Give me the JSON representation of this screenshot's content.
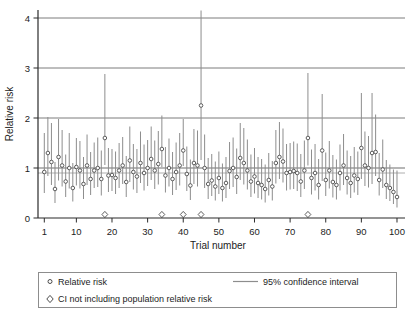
{
  "colors": {
    "background": "#ffffff",
    "axis": "#2b2b2b",
    "gridline": "#6e6e6e",
    "ci_line": "#8d8d8d",
    "marker_stroke": "#4c4c4c",
    "marker_fill": "#ffffff",
    "population_line": "#9a9a9a",
    "legend_border": "#8d8d8d",
    "text": "#1c1c1c"
  },
  "chart_data": {
    "type": "scatter",
    "title": "",
    "xlabel": "Trial number",
    "ylabel": "Relative risk",
    "x_ticks": [
      1,
      10,
      20,
      30,
      40,
      50,
      60,
      70,
      80,
      90,
      100
    ],
    "y_ticks": [
      0,
      1,
      2,
      3,
      4
    ],
    "xlim": [
      1,
      100
    ],
    "ylim": [
      0,
      4.16
    ],
    "grid": "horizontal-at-integer-y",
    "reference_lines": [
      {
        "name": "unity-gridline",
        "y": 1.0
      },
      {
        "name": "population-relative-risk",
        "y": 0.9
      }
    ],
    "legend_position": "bottom-box",
    "marker_legend": [
      {
        "marker": "open-circle",
        "label": "Relative risk"
      },
      {
        "marker": "open-diamond",
        "label": "CI not including population relative risk"
      },
      {
        "marker": "line",
        "label": "95% confidence interval"
      }
    ],
    "diamond_trials": [
      18,
      34,
      40,
      45,
      75
    ],
    "diamond_y": 0.07,
    "columns": [
      "trial",
      "rr",
      "ci_lo",
      "ci_hi"
    ],
    "rows": [
      [
        1,
        0.92,
        0.5,
        1.7
      ],
      [
        2,
        1.3,
        0.84,
        2.02
      ],
      [
        3,
        1.12,
        0.66,
        1.9
      ],
      [
        4,
        0.58,
        0.3,
        1.12
      ],
      [
        5,
        1.22,
        0.75,
        1.98
      ],
      [
        6,
        1.05,
        0.63,
        1.76
      ],
      [
        7,
        0.73,
        0.42,
        1.27
      ],
      [
        8,
        1.0,
        0.59,
        1.7
      ],
      [
        9,
        0.6,
        0.33,
        1.1
      ],
      [
        10,
        1.02,
        0.65,
        1.6
      ],
      [
        11,
        0.95,
        0.59,
        1.54
      ],
      [
        12,
        0.68,
        0.38,
        1.22
      ],
      [
        13,
        1.05,
        0.66,
        1.67
      ],
      [
        14,
        0.78,
        0.46,
        1.32
      ],
      [
        15,
        0.95,
        0.6,
        1.51
      ],
      [
        16,
        1.0,
        0.62,
        1.61
      ],
      [
        17,
        0.78,
        0.45,
        1.35
      ],
      [
        18,
        1.6,
        1.06,
        2.88
      ],
      [
        19,
        0.85,
        0.52,
        1.4
      ],
      [
        20,
        0.86,
        0.54,
        1.38
      ],
      [
        21,
        0.8,
        0.48,
        1.33
      ],
      [
        22,
        0.95,
        0.6,
        1.5
      ],
      [
        23,
        1.05,
        0.68,
        1.62
      ],
      [
        24,
        0.72,
        0.42,
        1.24
      ],
      [
        25,
        1.15,
        0.72,
        1.83
      ],
      [
        26,
        0.92,
        0.57,
        1.48
      ],
      [
        27,
        0.83,
        0.5,
        1.38
      ],
      [
        28,
        1.1,
        0.7,
        1.73
      ],
      [
        29,
        0.9,
        0.55,
        1.47
      ],
      [
        30,
        1.0,
        0.64,
        1.56
      ],
      [
        31,
        1.18,
        0.76,
        1.83
      ],
      [
        32,
        0.95,
        0.58,
        1.55
      ],
      [
        33,
        1.08,
        0.67,
        1.74
      ],
      [
        34,
        1.38,
        1.02,
        2.05
      ],
      [
        35,
        0.85,
        0.51,
        1.42
      ],
      [
        36,
        1.0,
        0.63,
        1.59
      ],
      [
        37,
        0.78,
        0.46,
        1.32
      ],
      [
        38,
        0.92,
        0.56,
        1.51
      ],
      [
        39,
        1.05,
        0.65,
        1.7
      ],
      [
        40,
        1.35,
        1.04,
        1.98
      ],
      [
        41,
        0.88,
        0.54,
        1.43
      ],
      [
        42,
        0.65,
        0.36,
        1.17
      ],
      [
        43,
        1.1,
        0.68,
        1.78
      ],
      [
        44,
        1.05,
        0.63,
        1.75
      ],
      [
        45,
        2.25,
        1.16,
        4.15
      ],
      [
        46,
        1.0,
        0.6,
        1.67
      ],
      [
        47,
        0.68,
        0.38,
        1.2
      ],
      [
        48,
        0.75,
        0.44,
        1.28
      ],
      [
        49,
        0.63,
        0.35,
        1.13
      ],
      [
        50,
        0.8,
        0.48,
        1.33
      ],
      [
        51,
        0.6,
        0.33,
        1.09
      ],
      [
        52,
        0.7,
        0.4,
        1.22
      ],
      [
        53,
        0.94,
        0.58,
        1.52
      ],
      [
        54,
        1.0,
        0.62,
        1.61
      ],
      [
        55,
        0.82,
        0.48,
        1.39
      ],
      [
        56,
        1.2,
        0.76,
        1.9
      ],
      [
        57,
        1.1,
        0.67,
        1.8
      ],
      [
        58,
        0.95,
        0.57,
        1.57
      ],
      [
        59,
        0.73,
        0.42,
        1.27
      ],
      [
        60,
        0.83,
        0.49,
        1.4
      ],
      [
        61,
        0.7,
        0.4,
        1.22
      ],
      [
        62,
        0.66,
        0.37,
        1.18
      ],
      [
        63,
        0.58,
        0.31,
        1.07
      ],
      [
        64,
        0.76,
        0.45,
        1.3
      ],
      [
        65,
        0.63,
        0.35,
        1.14
      ],
      [
        66,
        1.1,
        0.69,
        1.76
      ],
      [
        67,
        1.22,
        0.78,
        1.92
      ],
      [
        68,
        1.13,
        0.71,
        1.79
      ],
      [
        69,
        0.9,
        0.55,
        1.48
      ],
      [
        70,
        0.92,
        0.57,
        1.5
      ],
      [
        71,
        0.94,
        0.58,
        1.53
      ],
      [
        72,
        0.9,
        0.54,
        1.49
      ],
      [
        73,
        0.73,
        0.42,
        1.28
      ],
      [
        74,
        0.95,
        0.58,
        1.55
      ],
      [
        75,
        1.6,
        1.05,
        2.9
      ],
      [
        76,
        0.8,
        0.47,
        1.37
      ],
      [
        77,
        0.9,
        0.55,
        1.48
      ],
      [
        78,
        0.66,
        0.37,
        1.18
      ],
      [
        79,
        1.35,
        0.74,
        2.48
      ],
      [
        80,
        0.76,
        0.44,
        1.31
      ],
      [
        81,
        0.95,
        0.59,
        1.54
      ],
      [
        82,
        0.72,
        0.41,
        1.26
      ],
      [
        83,
        0.66,
        0.37,
        1.17
      ],
      [
        84,
        0.9,
        0.55,
        1.47
      ],
      [
        85,
        1.05,
        0.66,
        1.68
      ],
      [
        86,
        0.8,
        0.47,
        1.35
      ],
      [
        87,
        0.7,
        0.4,
        1.24
      ],
      [
        88,
        0.85,
        0.51,
        1.42
      ],
      [
        89,
        0.78,
        0.46,
        1.33
      ],
      [
        90,
        1.4,
        0.78,
        2.5
      ],
      [
        91,
        1.05,
        0.64,
        1.73
      ],
      [
        92,
        1.0,
        0.61,
        1.64
      ],
      [
        93,
        1.3,
        0.68,
        2.5
      ],
      [
        94,
        1.32,
        0.84,
        2.07
      ],
      [
        95,
        0.76,
        0.45,
        1.3
      ],
      [
        96,
        0.97,
        0.6,
        1.57
      ],
      [
        97,
        0.66,
        0.38,
        1.16
      ],
      [
        98,
        0.6,
        0.34,
        1.07
      ],
      [
        99,
        0.52,
        0.28,
        0.97
      ],
      [
        100,
        0.42,
        0.21,
        0.95
      ]
    ]
  },
  "legend": {
    "rr_label": "Relative risk",
    "ci_label": "95% confidence interval",
    "diamond_label": "CI not including population relative risk"
  },
  "axes": {
    "x_title": "Trial number",
    "y_title": "Relative risk"
  }
}
